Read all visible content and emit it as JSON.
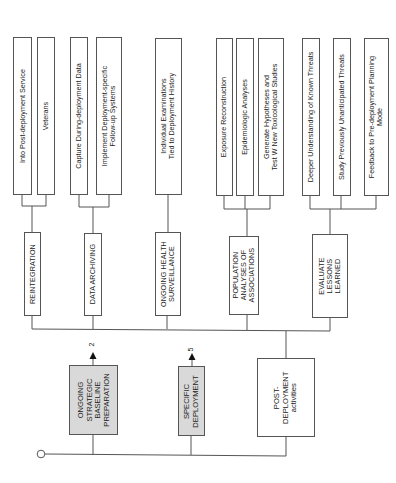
{
  "diagram": {
    "start_node": "start-circle",
    "root_nodes": [
      {
        "id": "ongoing-strategic-baseline-preparation",
        "label": "ONGOING\nSTRATEGIC\nBASELINE\nPREPARATION",
        "shaded": true,
        "arrow_ref": "2"
      },
      {
        "id": "specific-deployment",
        "label": "SPECIFIC\nDEPLOYMENT",
        "shaded": true,
        "arrow_ref": "5"
      },
      {
        "id": "post-deployment-activities",
        "label": "POST-\nDEPLOYMENT\nactivities",
        "shaded": false
      }
    ],
    "post_deployment_children": [
      {
        "label": "REINTEGRATION",
        "children": [
          "Into Post-deployment Service",
          "Veterans"
        ]
      },
      {
        "label": "DATA ARCHIVING",
        "children": [
          "Capture During-deployment Data",
          "Implement Deployment-specific\nFollow-up Systems"
        ]
      },
      {
        "label": "ONGOING HEALTH\nSURVEILLANCE",
        "children": [
          "Individual Examinations\nTied to Deployment History"
        ]
      },
      {
        "label": "POPULATION\nANALYSES OF\nASSOCIATIONS",
        "children": [
          "Exposure Reconstruction",
          "Epidemiologic Analyses",
          "Generate Hypotheses and\nTest W New Toxicological Studies"
        ]
      },
      {
        "label": "EVALUATE\nLESSONS\nLEARNED",
        "children": [
          "Deeper Understanding of Known Threats",
          "Study Previously Unanticipated Threats",
          "Feedback to Pre-deployment Planning\nMode"
        ]
      }
    ]
  },
  "labels": {
    "leaf_into_post": "Into Post-deployment Service",
    "leaf_veterans": "Veterans",
    "leaf_capture": "Capture During-deployment Data",
    "leaf_implement_1": "Implement Deployment-specific",
    "leaf_implement_2": "Follow-up Systems",
    "leaf_individual_1": "Individual Examinations",
    "leaf_individual_2": "Tied to Deployment History",
    "leaf_exposure": "Exposure Reconstruction",
    "leaf_epidemiologic": "Epidemiologic Analyses",
    "leaf_generate_1": "Generate Hypotheses and",
    "leaf_generate_2": "Test W New Toxicological Studies",
    "leaf_deeper": "Deeper Understanding of Known Threats",
    "leaf_study": "Study Previously Unanticipated Threats",
    "leaf_feedback_1": "Feedback to Pre-deployment Planning",
    "leaf_feedback_2": "Mode",
    "mid_reintegration": "REINTEGRATION",
    "mid_data_archiving": "DATA ARCHIVING",
    "mid_ongoing_1": "ONGOING HEALTH",
    "mid_ongoing_2": "SURVEILLANCE",
    "mid_population_1": "POPULATION",
    "mid_population_2": "ANALYSES OF",
    "mid_population_3": "ASSOCIATIONS",
    "mid_evaluate_1": "EVALUATE",
    "mid_evaluate_2": "LESSONS",
    "mid_evaluate_3": "LEARNED",
    "root_ongoing_1": "ONGOING",
    "root_ongoing_2": "STRATEGIC",
    "root_ongoing_3": "BASELINE",
    "root_ongoing_4": "PREPARATION",
    "root_specific_1": "SPECIFIC",
    "root_specific_2": "DEPLOYMENT",
    "root_post_1": "POST-",
    "root_post_2": "DEPLOYMENT",
    "root_post_3": "activities",
    "arrow_ref_ongoing": "2",
    "arrow_ref_specific": "5"
  },
  "colors": {
    "shaded_box": "#d9d9d9",
    "line": "#555555",
    "background": "#ffffff"
  }
}
